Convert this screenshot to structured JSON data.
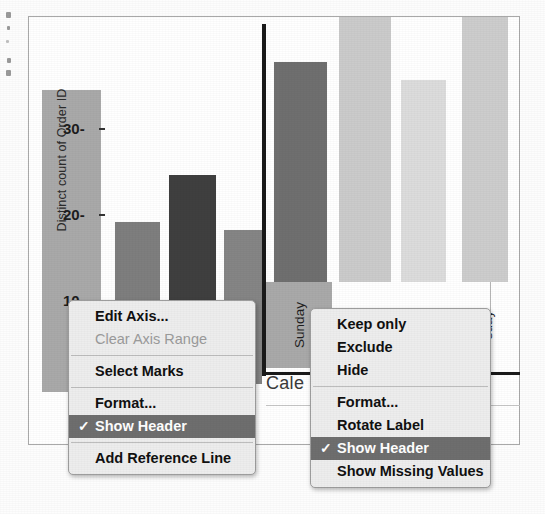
{
  "app": {
    "window_title": "Tableau axis context menus"
  },
  "left_chart": {
    "axis_title": "Distinct count of Order ID",
    "y_ticks": [
      "30",
      "20",
      "10"
    ],
    "axis_selected": true,
    "bars": [
      {
        "name": "bar-1",
        "height_pct": 100,
        "color": "#a9a9a9"
      },
      {
        "name": "bar-2",
        "height_pct": 57,
        "color": "#7e7e7e"
      },
      {
        "name": "bar-3",
        "height_pct": 73,
        "color": "#3f3f3f"
      },
      {
        "name": "bar-4",
        "height_pct": 54,
        "color": "#858585"
      }
    ]
  },
  "right_chart": {
    "caption": "Cale",
    "x_labels": [
      {
        "text": "Sunday",
        "selected": true
      },
      {
        "text": "nday",
        "selected": false
      },
      {
        "text": "sday",
        "selected": false
      },
      {
        "text": "sday",
        "selected": false
      }
    ],
    "bars": [
      {
        "name": "bar-1",
        "height_pct": 83,
        "color": "#6f6f6f"
      },
      {
        "name": "bar-2",
        "height_pct": 100,
        "color": "#cbcbcb"
      },
      {
        "name": "bar-3",
        "height_pct": 76,
        "color": "#dcdcdc"
      },
      {
        "name": "bar-4",
        "height_pct": 100,
        "color": "#cdcdcd"
      }
    ]
  },
  "colors": {
    "menu_background": "#ededed",
    "menu_highlight": "#6e6e6e",
    "menu_highlight_text": "#ffffff",
    "menu_disabled_text": "#9b9b9b",
    "selection_band": "#a9a9a9",
    "divider": "#1a1a1a"
  },
  "axis_menu": {
    "name": "y-axis-context-menu",
    "groups": [
      {
        "items": [
          {
            "label": "Edit Axis...",
            "state": "normal",
            "checked": false
          },
          {
            "label": "Clear Axis Range",
            "state": "disabled",
            "checked": false
          }
        ]
      },
      {
        "items": [
          {
            "label": "Select Marks",
            "state": "normal",
            "checked": false
          }
        ]
      },
      {
        "items": [
          {
            "label": "Format...",
            "state": "normal",
            "checked": false
          },
          {
            "label": "Show Header",
            "state": "highlight",
            "checked": true
          }
        ]
      },
      {
        "items": [
          {
            "label": "Add Reference Line",
            "state": "normal",
            "checked": false
          }
        ]
      }
    ]
  },
  "header_menu": {
    "name": "x-axis-header-context-menu",
    "groups": [
      {
        "items": [
          {
            "label": "Keep only",
            "state": "normal",
            "checked": false
          },
          {
            "label": "Exclude",
            "state": "normal",
            "checked": false
          },
          {
            "label": "Hide",
            "state": "normal",
            "checked": false
          }
        ]
      },
      {
        "items": [
          {
            "label": "Format...",
            "state": "normal",
            "checked": false
          },
          {
            "label": "Rotate Label",
            "state": "normal",
            "checked": false
          },
          {
            "label": "Show Header",
            "state": "highlight",
            "checked": true
          },
          {
            "label": "Show Missing Values",
            "state": "normal",
            "checked": false
          }
        ]
      }
    ]
  },
  "check_glyph": "✓"
}
